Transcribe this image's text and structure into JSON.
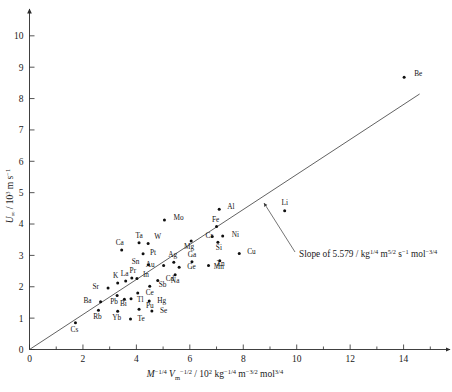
{
  "chart_data": {
    "type": "scatter",
    "title": "",
    "xlabel": "M^-1/4 V_m^-1/2 / 10^2 kg^-1/4 m^-3/2 mol^3/4",
    "ylabel": "U_inf / 10^3 m s^-1",
    "xlim": [
      0,
      15.4
    ],
    "ylim": [
      0,
      10.6
    ],
    "xticks": [
      0,
      2,
      4,
      6,
      8,
      10,
      12,
      14
    ],
    "xticklabels": [
      "0",
      "2",
      "4",
      "6",
      "8",
      "10",
      "12",
      "14"
    ],
    "xminorticks": [
      1,
      3,
      5,
      7,
      9,
      11,
      13,
      15
    ],
    "yticks": [
      0,
      1,
      2,
      3,
      4,
      5,
      6,
      7,
      8,
      9,
      10
    ],
    "yticklabels": [
      "0",
      "1",
      "2",
      "3",
      "4",
      "5",
      "6",
      "7",
      "8",
      "9",
      "10"
    ],
    "grid": false,
    "legend": null,
    "fit": {
      "slope": 5.579,
      "intercept": 0.0,
      "x_start": 0.0,
      "x_end": 14.6
    },
    "annotation": {
      "text_prefix": "Slope of 5.579 / kg",
      "exp1": "1/4",
      "mid1": " m",
      "exp2": "5/2",
      "mid2": " s",
      "exp3": "−1",
      "mid3": " mol",
      "exp4": "−3/4"
    },
    "points": [
      {
        "label": "Be",
        "x": 14.02,
        "y": 8.68,
        "lx": 10,
        "ly": -1
      },
      {
        "label": "Li",
        "x": 9.55,
        "y": 4.42,
        "lx": 0,
        "ly": -6
      },
      {
        "label": "Al",
        "x": 7.1,
        "y": 4.47,
        "lx": 8,
        "ly": 0
      },
      {
        "label": "Mo",
        "x": 5.05,
        "y": 4.13,
        "lx": 9,
        "ly": 0
      },
      {
        "label": "Fe",
        "x": 7.0,
        "y": 3.92,
        "lx": -1,
        "ly": -5
      },
      {
        "label": "Ni",
        "x": 7.23,
        "y": 3.62,
        "lx": 9,
        "ly": 1
      },
      {
        "label": "Cr",
        "x": 6.84,
        "y": 3.6,
        "lx": -3,
        "ly": 1
      },
      {
        "label": "Si",
        "x": 7.05,
        "y": 3.42,
        "lx": 1,
        "ly": 8
      },
      {
        "label": "Mg",
        "x": 6.05,
        "y": 3.46,
        "lx": -2,
        "ly": 8
      },
      {
        "label": "Ta",
        "x": 4.1,
        "y": 3.4,
        "lx": 0,
        "ly": -5
      },
      {
        "label": "W",
        "x": 4.44,
        "y": 3.38,
        "lx": 6,
        "ly": -4
      },
      {
        "label": "Ca",
        "x": 3.45,
        "y": 3.17,
        "lx": -2,
        "ly": -5
      },
      {
        "label": "Pt",
        "x": 4.25,
        "y": 3.05,
        "lx": 7,
        "ly": 1
      },
      {
        "label": "Cu",
        "x": 7.85,
        "y": 3.06,
        "lx": 8,
        "ly": 0
      },
      {
        "label": "Mn",
        "x": 7.12,
        "y": 2.83,
        "lx": -1,
        "ly": 8
      },
      {
        "label": "Ag",
        "x": 5.4,
        "y": 2.78,
        "lx": -1,
        "ly": -5
      },
      {
        "label": "Ga",
        "x": 6.08,
        "y": 2.8,
        "lx": 0,
        "ly": -5
      },
      {
        "label": "Zn",
        "x": 6.7,
        "y": 2.68,
        "lx": 8,
        "ly": 1
      },
      {
        "label": "Ge",
        "x": 5.6,
        "y": 2.62,
        "lx": 8,
        "ly": 2
      },
      {
        "label": "Au",
        "x": 5.02,
        "y": 2.68,
        "lx": -9,
        "ly": 2
      },
      {
        "label": "Sn",
        "x": 4.45,
        "y": 2.7,
        "lx": -9,
        "ly": -1
      },
      {
        "label": "Na",
        "x": 5.45,
        "y": 2.38,
        "lx": 0,
        "ly": 8
      },
      {
        "label": "Cd",
        "x": 4.8,
        "y": 2.2,
        "lx": 8,
        "ly": 1
      },
      {
        "label": "Sb",
        "x": 4.5,
        "y": 2.02,
        "lx": 9,
        "ly": 1
      },
      {
        "label": "In",
        "x": 4.02,
        "y": 2.26,
        "lx": 6,
        "ly": -2
      },
      {
        "label": "Pr",
        "x": 3.83,
        "y": 2.28,
        "lx": 1,
        "ly": -5
      },
      {
        "label": "La",
        "x": 3.6,
        "y": 2.18,
        "lx": -1,
        "ly": -5
      },
      {
        "label": "K",
        "x": 3.3,
        "y": 2.12,
        "lx": -2,
        "ly": -5
      },
      {
        "label": "Sr",
        "x": 2.94,
        "y": 1.96,
        "lx": -9,
        "ly": 1
      },
      {
        "label": "Ce",
        "x": 4.05,
        "y": 1.8,
        "lx": 8,
        "ly": 2
      },
      {
        "label": "Tl",
        "x": 3.8,
        "y": 1.62,
        "lx": 6,
        "ly": 3
      },
      {
        "label": "Bi",
        "x": 3.55,
        "y": 1.6,
        "lx": -1,
        "ly": 7
      },
      {
        "label": "Pb",
        "x": 3.28,
        "y": 1.72,
        "lx": -3,
        "ly": 8
      },
      {
        "label": "Hg",
        "x": 4.48,
        "y": 1.55,
        "lx": 8,
        "ly": 2
      },
      {
        "label": "Ba",
        "x": 2.66,
        "y": 1.52,
        "lx": -9,
        "ly": 1
      },
      {
        "label": "Pu",
        "x": 4.1,
        "y": 1.28,
        "lx": 7,
        "ly": -1
      },
      {
        "label": "Se",
        "x": 4.58,
        "y": 1.23,
        "lx": 8,
        "ly": 2
      },
      {
        "label": "Yb",
        "x": 3.3,
        "y": 1.22,
        "lx": -1,
        "ly": 9
      },
      {
        "label": "Rb",
        "x": 2.58,
        "y": 1.25,
        "lx": -1,
        "ly": 9
      },
      {
        "label": "Te",
        "x": 3.78,
        "y": 0.97,
        "lx": 7,
        "ly": 2
      },
      {
        "label": "Cs",
        "x": 1.72,
        "y": 0.85,
        "lx": -1,
        "ly": 9
      }
    ]
  }
}
